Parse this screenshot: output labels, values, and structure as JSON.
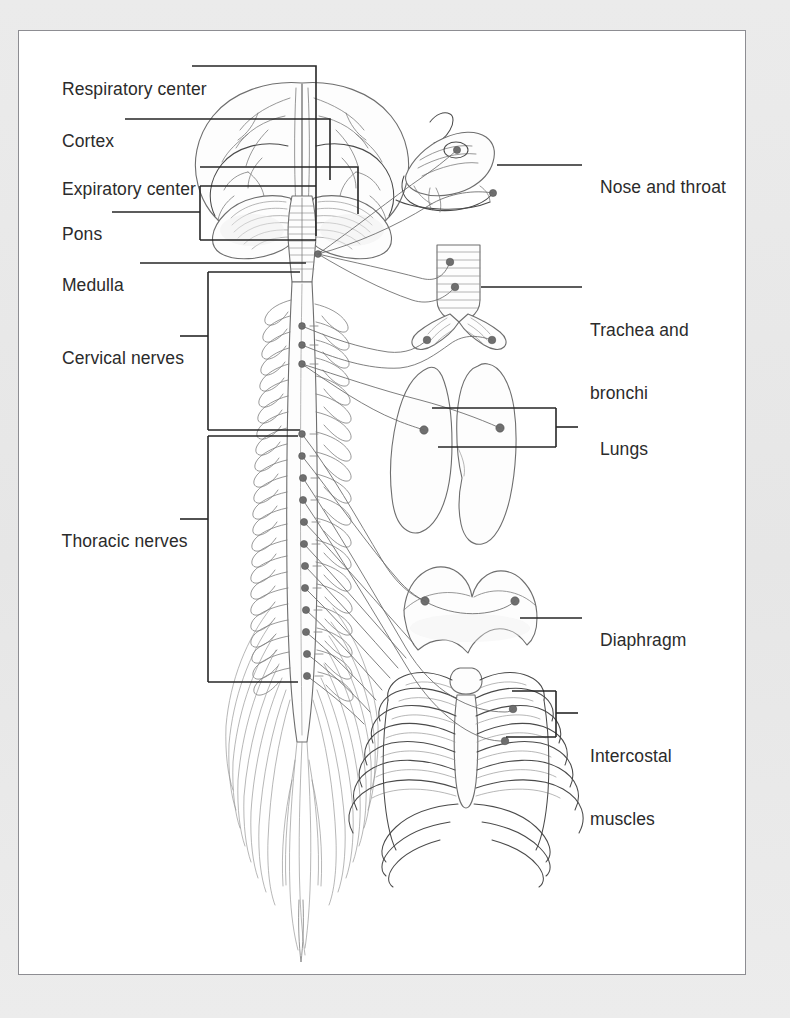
{
  "figure": {
    "kind": "anatomical-diagram",
    "view": "Posterior view of brain and spinal cord with respiratory organs",
    "frame": {
      "border_color": "#8d8d92",
      "background": "#ffffff"
    },
    "page_background": "#e9e9e9",
    "ink_color": "#3a3a3a",
    "marker_color": "#6b6b6b"
  },
  "labels": {
    "left": [
      {
        "id": "respiratory-center",
        "text": "Respiratory center",
        "x": 52,
        "y": 72,
        "leader": "line-elbow"
      },
      {
        "id": "cortex",
        "text": "Cortex",
        "x": 52,
        "y": 124,
        "leader": "line"
      },
      {
        "id": "expiratory-center",
        "text": "Expiratory center",
        "x": 52,
        "y": 172,
        "leader": "line"
      },
      {
        "id": "pons",
        "text": "Pons",
        "x": 52,
        "y": 217,
        "leader": "bracket"
      },
      {
        "id": "medulla",
        "text": "Medulla",
        "x": 52,
        "y": 268,
        "leader": "line"
      },
      {
        "id": "cervical-nerves",
        "text": "Cervical nerves",
        "x": 52,
        "y": 341,
        "leader": "bracket"
      },
      {
        "id": "thoracic-nerves",
        "text": "Thoracic nerves",
        "x": 52,
        "y": 524,
        "leader": "bracket"
      }
    ],
    "right": [
      {
        "id": "nose-and-throat",
        "text": "Nose and throat",
        "x": 590,
        "y": 170,
        "lines": [
          "Nose and throat"
        ],
        "leader": "line"
      },
      {
        "id": "trachea-and-bronchi",
        "text": "Trachea and bronchi",
        "x": 590,
        "y": 292,
        "lines": [
          "Trachea and",
          "bronchi"
        ],
        "leader": "line"
      },
      {
        "id": "lungs",
        "text": "Lungs",
        "x": 590,
        "y": 432,
        "lines": [
          "Lungs"
        ],
        "leader": "bracket"
      },
      {
        "id": "diaphragm",
        "text": "Diaphragm",
        "x": 590,
        "y": 623,
        "lines": [
          "Diaphragm"
        ],
        "leader": "line"
      },
      {
        "id": "intercostal-muscles",
        "text": "Intercostal muscles",
        "x": 590,
        "y": 718,
        "lines": [
          "Intercostal",
          "muscles"
        ],
        "leader": "bracket"
      }
    ]
  },
  "structures": [
    {
      "id": "brain",
      "name": "Brain (cerebrum and cerebellum, posterior view)"
    },
    {
      "id": "brainstem",
      "name": "Brainstem / medulla"
    },
    {
      "id": "spinal-cord",
      "name": "Spinal cord with segmental nerve roots"
    },
    {
      "id": "cauda-equina",
      "name": "Cauda equina"
    },
    {
      "id": "nose-throat",
      "name": "Sagittal section of nose and throat"
    },
    {
      "id": "trachea-bronchi",
      "name": "Trachea with cartilage rings branching to bronchi"
    },
    {
      "id": "lungs",
      "name": "Left and right lungs"
    },
    {
      "id": "diaphragm",
      "name": "Diaphragm dome"
    },
    {
      "id": "ribcage",
      "name": "Ribcage with sternum and intercostal muscles"
    }
  ]
}
